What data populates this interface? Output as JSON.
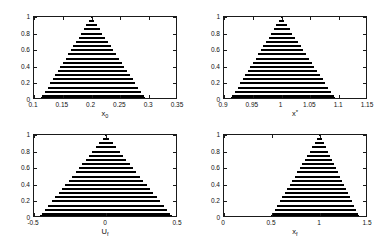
{
  "figure": {
    "type": "matlab-figure",
    "background": "#ffffff",
    "axis_color": "#1a1a1a",
    "bar_color": "#000000",
    "subplot_layout": "2x2"
  },
  "chart_data": [
    {
      "id": "subplot-1",
      "type": "bar",
      "orientation": "horizontal",
      "title": "",
      "xlabel": "x_0",
      "xlabel_base": "x",
      "xlabel_sub": "0",
      "ylabel": "",
      "xlim": [
        0.1,
        0.35
      ],
      "ylim": [
        0,
        1
      ],
      "xticks": [
        0.1,
        0.15,
        0.2,
        0.25,
        0.3,
        0.35
      ],
      "xticklabels": [
        "0.1",
        "0.15",
        "0.2",
        "0.25",
        "0.3",
        "0.35"
      ],
      "yticks": [
        0,
        0.2,
        0.4,
        0.6,
        0.8,
        1
      ],
      "yticklabels": [
        "0",
        "0.2",
        "0.4",
        "0.6",
        "0.8",
        "1"
      ],
      "grid": false,
      "legend": null,
      "peak_x": 0.2,
      "left_x": 0.11,
      "right_x": 0.295,
      "n_bars": 21,
      "bars": [
        {
          "y": 1.0,
          "x_start": 0.1985,
          "x_end": 0.2015
        },
        {
          "y": 0.95,
          "x_start": 0.1955,
          "x_end": 0.2046
        },
        {
          "y": 0.9,
          "x_start": 0.191,
          "x_end": 0.2094
        },
        {
          "y": 0.85,
          "x_start": 0.1865,
          "x_end": 0.2141
        },
        {
          "y": 0.8,
          "x_start": 0.182,
          "x_end": 0.2189
        },
        {
          "y": 0.75,
          "x_start": 0.1775,
          "x_end": 0.2237
        },
        {
          "y": 0.7,
          "x_start": 0.173,
          "x_end": 0.2285
        },
        {
          "y": 0.65,
          "x_start": 0.1685,
          "x_end": 0.2332
        },
        {
          "y": 0.6,
          "x_start": 0.164,
          "x_end": 0.238
        },
        {
          "y": 0.55,
          "x_start": 0.1595,
          "x_end": 0.2428
        },
        {
          "y": 0.5,
          "x_start": 0.155,
          "x_end": 0.2475
        },
        {
          "y": 0.45,
          "x_start": 0.1505,
          "x_end": 0.2523
        },
        {
          "y": 0.4,
          "x_start": 0.146,
          "x_end": 0.2571
        },
        {
          "y": 0.35,
          "x_start": 0.1415,
          "x_end": 0.2618
        },
        {
          "y": 0.3,
          "x_start": 0.137,
          "x_end": 0.2666
        },
        {
          "y": 0.25,
          "x_start": 0.1325,
          "x_end": 0.2714
        },
        {
          "y": 0.2,
          "x_start": 0.128,
          "x_end": 0.2762
        },
        {
          "y": 0.15,
          "x_start": 0.1235,
          "x_end": 0.2809
        },
        {
          "y": 0.1,
          "x_start": 0.119,
          "x_end": 0.2857
        },
        {
          "y": 0.05,
          "x_start": 0.1145,
          "x_end": 0.2905
        },
        {
          "y": 0.02,
          "x_start": 0.1118,
          "x_end": 0.2933
        }
      ]
    },
    {
      "id": "subplot-2",
      "type": "bar",
      "orientation": "horizontal",
      "title": "",
      "xlabel": "x*",
      "xlabel_base": "x",
      "xlabel_sup": "*",
      "ylabel": "",
      "xlim": [
        0.9,
        1.15
      ],
      "ylim": [
        0,
        1
      ],
      "xticks": [
        0.9,
        0.95,
        1.0,
        1.05,
        1.1,
        1.15
      ],
      "xticklabels": [
        "0.9",
        "0.95",
        "1",
        "1.05",
        "1.1",
        "1.15"
      ],
      "yticks": [
        0,
        0.2,
        0.4,
        0.6,
        0.8,
        1
      ],
      "yticklabels": [
        "0",
        "0.2",
        "0.4",
        "0.6",
        "0.8",
        "1"
      ],
      "grid": false,
      "legend": null,
      "peak_x": 1.0,
      "left_x": 0.91,
      "right_x": 1.095,
      "n_bars": 21,
      "bars": [
        {
          "y": 1.0,
          "x_start": 0.9985,
          "x_end": 1.0015
        },
        {
          "y": 0.95,
          "x_start": 0.9955,
          "x_end": 1.0046
        },
        {
          "y": 0.9,
          "x_start": 0.991,
          "x_end": 1.0094
        },
        {
          "y": 0.85,
          "x_start": 0.9865,
          "x_end": 1.0141
        },
        {
          "y": 0.8,
          "x_start": 0.982,
          "x_end": 1.0189
        },
        {
          "y": 0.75,
          "x_start": 0.9775,
          "x_end": 1.0237
        },
        {
          "y": 0.7,
          "x_start": 0.973,
          "x_end": 1.0285
        },
        {
          "y": 0.65,
          "x_start": 0.9685,
          "x_end": 1.0332
        },
        {
          "y": 0.6,
          "x_start": 0.964,
          "x_end": 1.038
        },
        {
          "y": 0.55,
          "x_start": 0.9595,
          "x_end": 1.0428
        },
        {
          "y": 0.5,
          "x_start": 0.955,
          "x_end": 1.0475
        },
        {
          "y": 0.45,
          "x_start": 0.9505,
          "x_end": 1.0523
        },
        {
          "y": 0.4,
          "x_start": 0.946,
          "x_end": 1.0571
        },
        {
          "y": 0.35,
          "x_start": 0.9415,
          "x_end": 1.0618
        },
        {
          "y": 0.3,
          "x_start": 0.937,
          "x_end": 1.0666
        },
        {
          "y": 0.25,
          "x_start": 0.9325,
          "x_end": 1.0714
        },
        {
          "y": 0.2,
          "x_start": 0.928,
          "x_end": 1.0762
        },
        {
          "y": 0.15,
          "x_start": 0.9235,
          "x_end": 1.0809
        },
        {
          "y": 0.1,
          "x_start": 0.919,
          "x_end": 1.0857
        },
        {
          "y": 0.05,
          "x_start": 0.9145,
          "x_end": 1.0905
        },
        {
          "y": 0.02,
          "x_start": 0.9118,
          "x_end": 1.0933
        }
      ]
    },
    {
      "id": "subplot-3",
      "type": "bar",
      "orientation": "horizontal",
      "title": "",
      "xlabel": "U_f",
      "xlabel_base": "U",
      "xlabel_sub": "f",
      "ylabel": "",
      "xlim": [
        -0.5,
        0.5
      ],
      "ylim": [
        0,
        1
      ],
      "xticks": [
        -0.5,
        0,
        0.5
      ],
      "xticklabels": [
        "-0.5",
        "0",
        "0.5"
      ],
      "yticks": [
        0,
        0.2,
        0.4,
        0.6,
        0.8,
        1
      ],
      "yticklabels": [
        "0",
        "0.2",
        "0.4",
        "0.6",
        "0.8",
        "1"
      ],
      "grid": false,
      "legend": null,
      "peak_x": 0.0,
      "left_x": -0.47,
      "right_x": 0.47,
      "n_bars": 21,
      "bars": [
        {
          "y": 1.0,
          "x_start": -0.008,
          "x_end": 0.008
        },
        {
          "y": 0.95,
          "x_start": -0.0235,
          "x_end": 0.0235
        },
        {
          "y": 0.9,
          "x_start": -0.047,
          "x_end": 0.047
        },
        {
          "y": 0.85,
          "x_start": -0.0705,
          "x_end": 0.0705
        },
        {
          "y": 0.8,
          "x_start": -0.094,
          "x_end": 0.094
        },
        {
          "y": 0.75,
          "x_start": -0.1175,
          "x_end": 0.1175
        },
        {
          "y": 0.7,
          "x_start": -0.141,
          "x_end": 0.141
        },
        {
          "y": 0.65,
          "x_start": -0.1645,
          "x_end": 0.1645
        },
        {
          "y": 0.6,
          "x_start": -0.188,
          "x_end": 0.188
        },
        {
          "y": 0.55,
          "x_start": -0.2115,
          "x_end": 0.2115
        },
        {
          "y": 0.5,
          "x_start": -0.235,
          "x_end": 0.235
        },
        {
          "y": 0.45,
          "x_start": -0.2585,
          "x_end": 0.2585
        },
        {
          "y": 0.4,
          "x_start": -0.282,
          "x_end": 0.282
        },
        {
          "y": 0.35,
          "x_start": -0.3055,
          "x_end": 0.3055
        },
        {
          "y": 0.3,
          "x_start": -0.329,
          "x_end": 0.329
        },
        {
          "y": 0.25,
          "x_start": -0.3525,
          "x_end": 0.3525
        },
        {
          "y": 0.2,
          "x_start": -0.376,
          "x_end": 0.376
        },
        {
          "y": 0.15,
          "x_start": -0.3995,
          "x_end": 0.3995
        },
        {
          "y": 0.1,
          "x_start": -0.423,
          "x_end": 0.423
        },
        {
          "y": 0.05,
          "x_start": -0.4465,
          "x_end": 0.4465
        },
        {
          "y": 0.02,
          "x_start": -0.4606,
          "x_end": 0.4606
        }
      ]
    },
    {
      "id": "subplot-4",
      "type": "bar",
      "orientation": "horizontal",
      "title": "",
      "xlabel": "x_f",
      "xlabel_base": "x",
      "xlabel_sub": "f",
      "ylabel": "",
      "xlim": [
        0,
        1.5
      ],
      "ylim": [
        0,
        1
      ],
      "xticks": [
        0,
        0.5,
        1.0,
        1.5
      ],
      "xticklabels": [
        "0",
        "0.5",
        "1",
        "1.5"
      ],
      "yticks": [
        0,
        0.2,
        0.4,
        0.6,
        0.8,
        1
      ],
      "yticklabels": [
        "0",
        "0.2",
        "0.4",
        "0.6",
        "0.8",
        "1"
      ],
      "grid": false,
      "legend": null,
      "peak_x": 1.0,
      "left_x": 0.475,
      "right_x": 1.42,
      "n_bars": 21,
      "bars": [
        {
          "y": 1.0,
          "x_start": 0.992,
          "x_end": 1.008
        },
        {
          "y": 0.95,
          "x_start": 0.9737,
          "x_end": 1.021
        },
        {
          "y": 0.9,
          "x_start": 0.9475,
          "x_end": 1.042
        },
        {
          "y": 0.85,
          "x_start": 0.9212,
          "x_end": 1.063
        },
        {
          "y": 0.8,
          "x_start": 0.895,
          "x_end": 1.084
        },
        {
          "y": 0.75,
          "x_start": 0.8687,
          "x_end": 1.105
        },
        {
          "y": 0.7,
          "x_start": 0.8425,
          "x_end": 1.126
        },
        {
          "y": 0.65,
          "x_start": 0.8162,
          "x_end": 1.147
        },
        {
          "y": 0.6,
          "x_start": 0.79,
          "x_end": 1.168
        },
        {
          "y": 0.55,
          "x_start": 0.7637,
          "x_end": 1.189
        },
        {
          "y": 0.5,
          "x_start": 0.7375,
          "x_end": 1.21
        },
        {
          "y": 0.45,
          "x_start": 0.7112,
          "x_end": 1.231
        },
        {
          "y": 0.4,
          "x_start": 0.685,
          "x_end": 1.252
        },
        {
          "y": 0.35,
          "x_start": 0.6587,
          "x_end": 1.273
        },
        {
          "y": 0.3,
          "x_start": 0.6325,
          "x_end": 1.294
        },
        {
          "y": 0.25,
          "x_start": 0.6062,
          "x_end": 1.315
        },
        {
          "y": 0.2,
          "x_start": 0.58,
          "x_end": 1.336
        },
        {
          "y": 0.15,
          "x_start": 0.5537,
          "x_end": 1.357
        },
        {
          "y": 0.1,
          "x_start": 0.5275,
          "x_end": 1.378
        },
        {
          "y": 0.05,
          "x_start": 0.5012,
          "x_end": 1.399
        },
        {
          "y": 0.02,
          "x_start": 0.4855,
          "x_end": 1.4116
        }
      ]
    }
  ]
}
